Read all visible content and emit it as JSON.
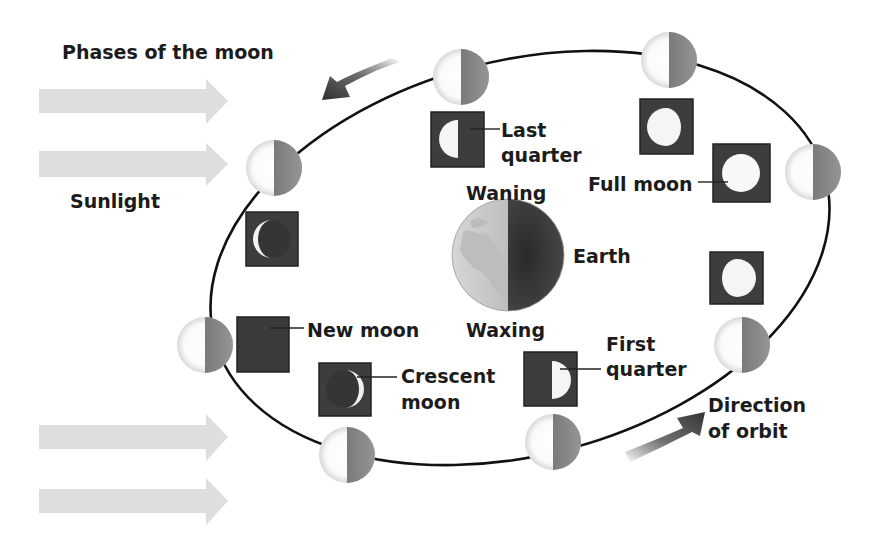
{
  "title": "Phases of the moon",
  "labels": {
    "sunlight": "Sunlight",
    "last_quarter_1": "Last",
    "last_quarter_2": "quarter",
    "waning": "Waning",
    "full_moon": "Full moon",
    "earth": "Earth",
    "new_moon": "New moon",
    "waxing": "Waxing",
    "crescent_1": "Crescent",
    "crescent_2": "moon",
    "first_quarter_1": "First",
    "first_quarter_2": "quarter",
    "direction_1": "Direction",
    "direction_2": "of orbit"
  },
  "colors": {
    "background": "#ffffff",
    "sunlight_arrow": "#dcdcdc",
    "orbit_line": "#111111",
    "moon_lit": "#f4f4f4",
    "moon_dark": "#8a8a8a",
    "phase_box": "#3d3d3d",
    "earth_lit": "#c8c8c8",
    "earth_dark": "#3a3a3a",
    "direction_arrow": "#3a3a3a"
  },
  "orbit_moons": [
    {
      "position": "top-left",
      "cx": 274,
      "cy": 168
    },
    {
      "position": "top",
      "cx": 461,
      "cy": 77
    },
    {
      "position": "top-right",
      "cx": 669,
      "cy": 60
    },
    {
      "position": "right",
      "cx": 813,
      "cy": 172
    },
    {
      "position": "lower-right",
      "cx": 742,
      "cy": 345
    },
    {
      "position": "bottom-right",
      "cx": 553,
      "cy": 442
    },
    {
      "position": "bottom-left",
      "cx": 347,
      "cy": 455
    },
    {
      "position": "left",
      "cx": 205,
      "cy": 345
    }
  ],
  "phase_views": [
    {
      "name": "Waning crescent",
      "x": 246,
      "y": 212
    },
    {
      "name": "Last quarter",
      "x": 431,
      "y": 112
    },
    {
      "name": "Waning gibbous",
      "x": 640,
      "y": 99
    },
    {
      "name": "Full moon",
      "x": 713,
      "y": 144
    },
    {
      "name": "Waxing gibbous",
      "x": 710,
      "y": 252
    },
    {
      "name": "First quarter",
      "x": 524,
      "y": 352
    },
    {
      "name": "Crescent moon",
      "x": 319,
      "y": 363
    },
    {
      "name": "New moon",
      "x": 237,
      "y": 317
    }
  ],
  "earth": {
    "cx": 508,
    "cy": 255,
    "r": 56
  }
}
